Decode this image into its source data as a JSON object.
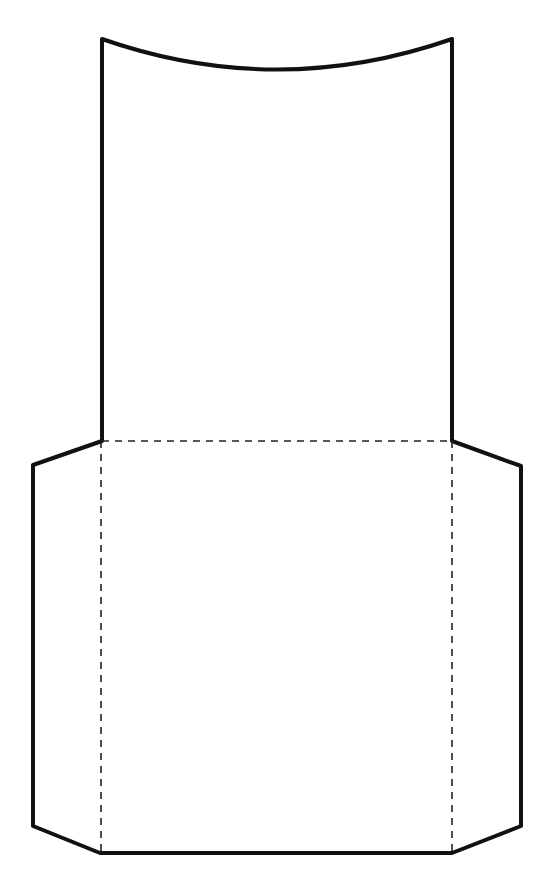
{
  "diagram": {
    "type": "envelope-pocket-template",
    "colors": {
      "background": "#ffffff",
      "cut_line": "#111111",
      "fold_line": "#222222"
    },
    "cut_outline": {
      "description": "solid outer cut line",
      "path": "M102,39 Q277,100 452,39 L452,441 L521,466 L521,826 L452,853 L100,853 L33,826 L33,465 L102,441 Z"
    },
    "fold_lines": [
      {
        "name": "top-fold",
        "x1": 102,
        "y1": 441,
        "x2": 452,
        "y2": 441
      },
      {
        "name": "left-fold",
        "x1": 101,
        "y1": 441,
        "x2": 101,
        "y2": 853
      },
      {
        "name": "right-fold",
        "x1": 452,
        "y1": 441,
        "x2": 452,
        "y2": 853
      }
    ]
  }
}
